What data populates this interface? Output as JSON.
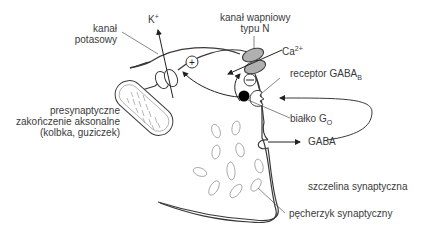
{
  "diagram": {
    "labels": {
      "potassium_channel": {
        "line1": "kanał",
        "line2": "potasowy"
      },
      "potassium_ion": {
        "base": "K",
        "sup": "+"
      },
      "calcium_channel": {
        "line1": "kanał wapniowy",
        "line2": "typu N"
      },
      "calcium_ion": {
        "base": "Ca",
        "sup": "2+"
      },
      "gaba_b_receptor": {
        "base": "receptor GABA",
        "sub": "B"
      },
      "g_protein": {
        "base": "białko G",
        "sub": "O"
      },
      "gaba": "GABA",
      "presynaptic_terminal": {
        "line1": "presynaptyczne",
        "line2": "zakończenie aksonalne",
        "line3": "(kolbka, guziczek)"
      },
      "synaptic_cleft": "szczelina synaptyczna",
      "synaptic_vesicle": "pęcherzyk synaptyczny"
    },
    "symbols": {
      "plus": "+",
      "minus": "−"
    },
    "colors": {
      "stroke": "#3a3a3a",
      "calcium_channel_fill": "#b0b0b0",
      "g_protein_fill": "#000000",
      "vesicle_stroke": "#9a9a9a"
    }
  }
}
